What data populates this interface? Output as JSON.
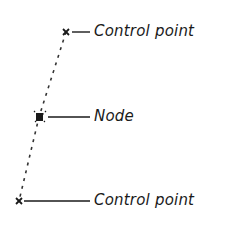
{
  "diagram": {
    "title": "",
    "colors": {
      "ink": "#1a1a1a",
      "dotted": "#333333"
    },
    "points": [
      {
        "id": "cp-top",
        "type": "control-point",
        "x": 66,
        "y": 32,
        "label": "Control point"
      },
      {
        "id": "node",
        "type": "node",
        "x": 39,
        "y": 117,
        "label": "Node"
      },
      {
        "id": "cp-bottom",
        "type": "control-point",
        "x": 19,
        "y": 201,
        "label": "Control point"
      }
    ],
    "labels": {
      "top": "Control point",
      "middle": "Node",
      "bottom": "Control point"
    }
  }
}
